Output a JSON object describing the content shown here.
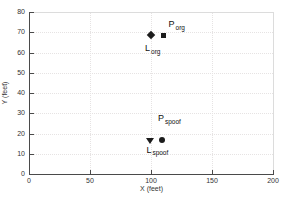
{
  "chart_data": {
    "type": "scatter",
    "title": "",
    "xlabel": "X (feet)",
    "ylabel": "Y (feet)",
    "xlim": [
      0,
      200
    ],
    "ylim": [
      0,
      80
    ],
    "x_ticks": [
      0,
      50,
      100,
      150,
      200
    ],
    "y_ticks": [
      0,
      10,
      20,
      30,
      40,
      50,
      60,
      70,
      80
    ],
    "grid": true,
    "legend": "none",
    "grid_color": "#e6e3e3",
    "axis_color": "#4a4a4a",
    "box_color": "#dcdcdc",
    "marker_color": "#1c1c1c",
    "text_color": "#333333",
    "series": [
      {
        "name": "L_org",
        "marker": "diamond",
        "x": 100,
        "y": 68.5,
        "label_main": "L",
        "label_sub": "org",
        "label_dx": -6,
        "label_dy": 9
      },
      {
        "name": "P_org",
        "marker": "square",
        "x": 109.5,
        "y": 68.5,
        "label_main": "P",
        "label_sub": "org",
        "label_dx": 6,
        "label_dy": -15
      },
      {
        "name": "L_spoof",
        "marker": "triangle-down",
        "x": 99.5,
        "y": 16.3,
        "label_main": "L",
        "label_sub": "spoof",
        "label_dx": -4,
        "label_dy": 5
      },
      {
        "name": "P_spoof",
        "marker": "circle",
        "x": 109,
        "y": 16.6,
        "label_main": "P",
        "label_sub": "spoof",
        "label_dx": -4,
        "label_dy": -26
      }
    ]
  }
}
